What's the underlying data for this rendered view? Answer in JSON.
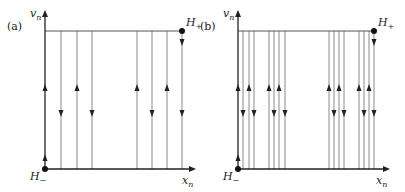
{
  "panels": [
    {
      "id": "a",
      "label": "(a)",
      "y_axis_label": "v",
      "y_axis_sub": "n",
      "x_axis_label": "x",
      "x_axis_sub": "n",
      "top_point_label": "H",
      "top_point_sub": "+",
      "bottom_point_label": "H",
      "bottom_point_sub": "−",
      "origin": [
        45,
        169
      ],
      "top_y": 31,
      "x_axis_end": 196,
      "y_axis_end": 10,
      "right_x": 182,
      "lines": [
        61,
        77,
        92,
        137,
        152,
        167,
        182
      ],
      "up_arrows": [
        45,
        77,
        137,
        167
      ],
      "down_arrows": [
        61,
        92,
        152,
        182
      ]
    },
    {
      "id": "b",
      "label": "(b)",
      "y_axis_label": "v",
      "y_axis_sub": "n",
      "x_axis_label": "x",
      "x_axis_sub": "n",
      "top_point_label": "H",
      "top_point_sub": "+",
      "bottom_point_label": "H",
      "bottom_point_sub": "−",
      "origin": [
        238,
        169
      ],
      "top_y": 31,
      "x_axis_end": 390,
      "y_axis_end": 10,
      "right_x": 374,
      "lines": [
        243,
        249,
        254,
        269,
        274,
        279,
        285,
        329,
        334,
        339,
        344,
        359,
        364,
        369,
        374
      ],
      "up_arrows": [
        238,
        249,
        269,
        279,
        329,
        339,
        359,
        369
      ],
      "down_arrows": [
        243,
        254,
        274,
        285,
        334,
        344,
        364,
        374
      ]
    }
  ]
}
